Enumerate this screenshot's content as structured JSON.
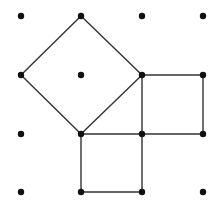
{
  "diagram": {
    "type": "dot-grid-geometry",
    "grid": {
      "cols": 4,
      "rows": 4,
      "x_positions": [
        21,
        81,
        142,
        203
      ],
      "y_positions": [
        16,
        75,
        134,
        192
      ],
      "dot_radius": 3.2,
      "dot_color": "#111111"
    },
    "line_color": "#333333",
    "line_width": 1.4,
    "shapes": [
      {
        "name": "tilted-square",
        "vertices": [
          [
            1,
            0
          ],
          [
            2,
            1
          ],
          [
            1,
            2
          ],
          [
            0,
            1
          ]
        ]
      },
      {
        "name": "right-square",
        "vertices": [
          [
            2,
            1
          ],
          [
            3,
            1
          ],
          [
            3,
            2
          ],
          [
            2,
            2
          ]
        ]
      },
      {
        "name": "bottom-square",
        "vertices": [
          [
            1,
            2
          ],
          [
            2,
            2
          ],
          [
            2,
            3
          ],
          [
            1,
            3
          ]
        ]
      }
    ]
  }
}
